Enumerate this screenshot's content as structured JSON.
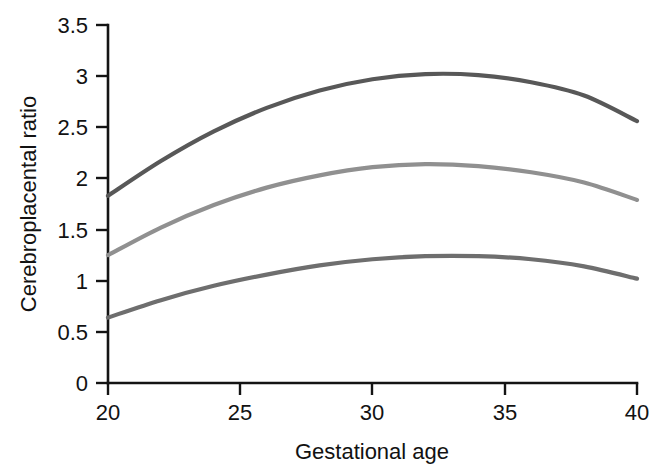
{
  "chart_data": {
    "type": "line",
    "title": "",
    "xlabel": "Gestational age",
    "ylabel": "Cerebroplacental ratio",
    "xlim": [
      20,
      40
    ],
    "ylim": [
      0,
      3.5
    ],
    "xticks": [
      20,
      25,
      30,
      35,
      40
    ],
    "yticks": [
      0,
      0.5,
      1,
      1.5,
      2,
      2.5,
      3,
      3.5
    ],
    "xtick_labels": [
      "20",
      "25",
      "30",
      "35",
      "40"
    ],
    "ytick_labels": [
      "0",
      "0.5",
      "1",
      "1.5",
      "2",
      "2.5",
      "3",
      "3.5"
    ],
    "grid": false,
    "legend": "none",
    "x": [
      20,
      22,
      24,
      26,
      28,
      30,
      32,
      34,
      36,
      38,
      40
    ],
    "series": [
      {
        "name": "upper-curve",
        "color": "#585858",
        "values": [
          1.83,
          2.17,
          2.46,
          2.69,
          2.86,
          2.97,
          3.02,
          3.01,
          2.94,
          2.81,
          2.56
        ]
      },
      {
        "name": "middle-curve",
        "color": "#909090",
        "values": [
          1.25,
          1.52,
          1.74,
          1.91,
          2.03,
          2.11,
          2.14,
          2.12,
          2.06,
          1.96,
          1.79
        ]
      },
      {
        "name": "lower-curve",
        "color": "#6e6e6e",
        "values": [
          0.64,
          0.81,
          0.95,
          1.06,
          1.15,
          1.21,
          1.24,
          1.24,
          1.21,
          1.14,
          1.02
        ]
      }
    ]
  },
  "axes": {
    "y_title": "Cerebroplacental ratio",
    "x_title": "Gestational age"
  },
  "colors": {
    "axis": "#141414",
    "text": "#121212",
    "background": "#ffffff",
    "upper_curve": "#585858",
    "middle_curve": "#909090",
    "lower_curve": "#6e6e6e"
  }
}
